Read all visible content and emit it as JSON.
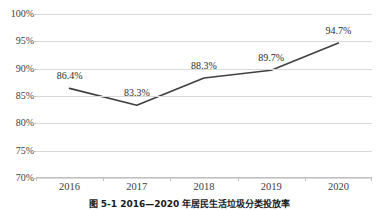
{
  "chart_data": {
    "type": "line",
    "title": "",
    "xlabel": "",
    "ylabel": "",
    "categories": [
      "2016",
      "2017",
      "2018",
      "2019",
      "2020"
    ],
    "values": [
      86.4,
      83.3,
      88.3,
      89.7,
      94.7
    ],
    "data_labels": [
      "86.4%",
      "83.3%",
      "88.3%",
      "89.7%",
      "94.7%"
    ],
    "ylim": [
      70,
      100
    ],
    "ytick_values": [
      100,
      95,
      90,
      85,
      80,
      75,
      70
    ],
    "ytick_labels": [
      "100%",
      "95%",
      "90%",
      "85%",
      "80%",
      "75%",
      "70%"
    ],
    "grid": "horizontal",
    "legend": "none",
    "series": [
      {
        "name": "",
        "values": [
          86.4,
          83.3,
          88.3,
          89.7,
          94.7
        ]
      }
    ],
    "colors": {
      "line": "#404040",
      "gridline": "#d9d9d9",
      "axis": "#bfbfbf",
      "tick_text": "#404040",
      "data_label_text": "#2b2b2b",
      "background": "#ffffff"
    }
  },
  "caption": {
    "text": "图 5-1  2016—2020 年居民生活垃圾分类投放率"
  }
}
